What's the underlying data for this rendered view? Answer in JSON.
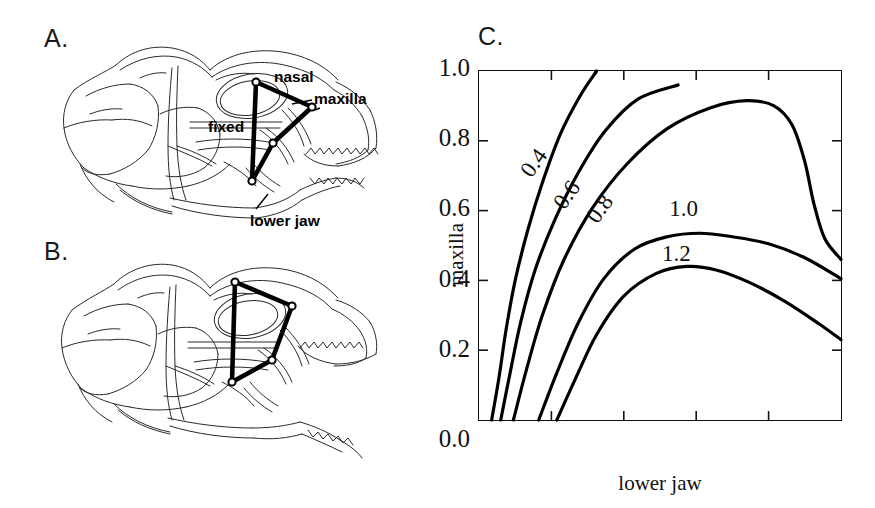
{
  "figure": {
    "panels": [
      {
        "id": "A",
        "label": "A.",
        "caption_role": "skull-jaw-closed"
      },
      {
        "id": "B",
        "label": "B.",
        "caption_role": "skull-jaw-open"
      },
      {
        "id": "C",
        "label": "C.",
        "caption_role": "contour-plot"
      }
    ]
  },
  "panel_a": {
    "label": "A.",
    "annotations": [
      {
        "name": "nasal",
        "text": "nasal"
      },
      {
        "name": "maxilla",
        "text": "maxilla"
      },
      {
        "name": "fixed",
        "text": "fixed"
      },
      {
        "name": "lower_jaw",
        "text": "lower jaw"
      }
    ],
    "linkage_nodes": [
      {
        "name": "nasal-joint",
        "x": 256,
        "y": 82
      },
      {
        "name": "maxilla-joint",
        "x": 312,
        "y": 107
      },
      {
        "name": "mid-joint",
        "x": 273,
        "y": 143
      },
      {
        "name": "lower-jaw-joint",
        "x": 252,
        "y": 181
      }
    ]
  },
  "panel_b": {
    "label": "B.",
    "linkage_nodes": [
      {
        "name": "nasal-joint",
        "x": 235,
        "y": 282
      },
      {
        "name": "maxilla-joint",
        "x": 292,
        "y": 306
      },
      {
        "name": "mid-joint",
        "x": 272,
        "y": 360
      },
      {
        "name": "lower-jaw-joint",
        "x": 232,
        "y": 382
      }
    ]
  },
  "chart_data": {
    "type": "line",
    "subtype": "contour",
    "title": "C.",
    "xlabel": "lower jaw",
    "ylabel": "maxilla",
    "xlim": [
      0,
      1
    ],
    "ylim": [
      0,
      1
    ],
    "grid": false,
    "legend": "none",
    "ytick_labels": [
      "1.0",
      "0.8",
      "0.6",
      "0.4",
      "0.2",
      "0.0"
    ],
    "ytick_values": [
      1.0,
      0.8,
      0.6,
      0.4,
      0.2,
      0.0
    ],
    "xtick_values": [
      0.2,
      0.4,
      0.6,
      0.8
    ],
    "xtick_labels": [
      "",
      "",
      "",
      ""
    ],
    "contour_levels": [
      0.4,
      0.6,
      0.8,
      1.0,
      1.2
    ],
    "series": [
      {
        "name": "0.4",
        "label": "0.4",
        "level": 0.4,
        "label_rotation": -55,
        "points": [
          [
            0.035,
            0.0
          ],
          [
            0.055,
            0.12
          ],
          [
            0.075,
            0.26
          ],
          [
            0.1,
            0.4
          ],
          [
            0.135,
            0.545
          ],
          [
            0.175,
            0.68
          ],
          [
            0.225,
            0.82
          ],
          [
            0.28,
            0.93
          ],
          [
            0.325,
            1.0
          ]
        ]
      },
      {
        "name": "0.6",
        "label": "0.6",
        "level": 0.6,
        "label_rotation": -55,
        "points": [
          [
            0.06,
            0.0
          ],
          [
            0.085,
            0.13
          ],
          [
            0.115,
            0.28
          ],
          [
            0.155,
            0.43
          ],
          [
            0.21,
            0.575
          ],
          [
            0.275,
            0.71
          ],
          [
            0.35,
            0.83
          ],
          [
            0.44,
            0.92
          ],
          [
            0.55,
            0.96
          ]
        ]
      },
      {
        "name": "0.8",
        "label": "0.8",
        "level": 0.8,
        "label_rotation": -55,
        "points": [
          [
            0.095,
            0.0
          ],
          [
            0.13,
            0.14
          ],
          [
            0.175,
            0.3
          ],
          [
            0.235,
            0.46
          ],
          [
            0.315,
            0.61
          ],
          [
            0.41,
            0.735
          ],
          [
            0.52,
            0.835
          ],
          [
            0.64,
            0.895
          ],
          [
            0.74,
            0.915
          ],
          [
            0.815,
            0.9
          ],
          [
            0.865,
            0.845
          ],
          [
            0.9,
            0.74
          ],
          [
            0.925,
            0.62
          ],
          [
            0.955,
            0.52
          ],
          [
            1.0,
            0.46
          ]
        ]
      },
      {
        "name": "1.0",
        "label": "1.0",
        "level": 1.0,
        "label_rotation": 0,
        "points": [
          [
            0.165,
            0.0
          ],
          [
            0.215,
            0.135
          ],
          [
            0.275,
            0.28
          ],
          [
            0.345,
            0.405
          ],
          [
            0.43,
            0.49
          ],
          [
            0.52,
            0.525
          ],
          [
            0.61,
            0.535
          ],
          [
            0.7,
            0.525
          ],
          [
            0.8,
            0.505
          ],
          [
            0.9,
            0.465
          ],
          [
            1.0,
            0.405
          ]
        ]
      },
      {
        "name": "1.2",
        "label": "1.2",
        "level": 1.2,
        "label_rotation": 0,
        "points": [
          [
            0.215,
            0.0
          ],
          [
            0.265,
            0.115
          ],
          [
            0.325,
            0.245
          ],
          [
            0.4,
            0.355
          ],
          [
            0.49,
            0.42
          ],
          [
            0.575,
            0.44
          ],
          [
            0.655,
            0.43
          ],
          [
            0.745,
            0.395
          ],
          [
            0.845,
            0.34
          ],
          [
            0.94,
            0.275
          ],
          [
            1.0,
            0.23
          ]
        ]
      }
    ]
  }
}
